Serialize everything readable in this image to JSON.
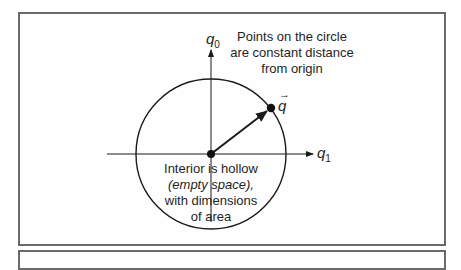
{
  "diagram": {
    "axes": {
      "vertical_label": "q",
      "vertical_sub": "0",
      "horizontal_label": "q",
      "horizontal_sub": "1"
    },
    "vector": {
      "label": "q",
      "arrow": "→"
    },
    "annotations": {
      "top_line1": "Points on the circle",
      "top_line2": "are constant distance",
      "top_line3": "from origin",
      "interior_line1": "Interior is hollow",
      "interior_line2": "(empty space),",
      "interior_line3": "with dimensions",
      "interior_line4": "of area"
    },
    "colors": {
      "frame": "#6a6a6a",
      "ink": "#1a1a1a",
      "background": "#ffffff"
    }
  }
}
